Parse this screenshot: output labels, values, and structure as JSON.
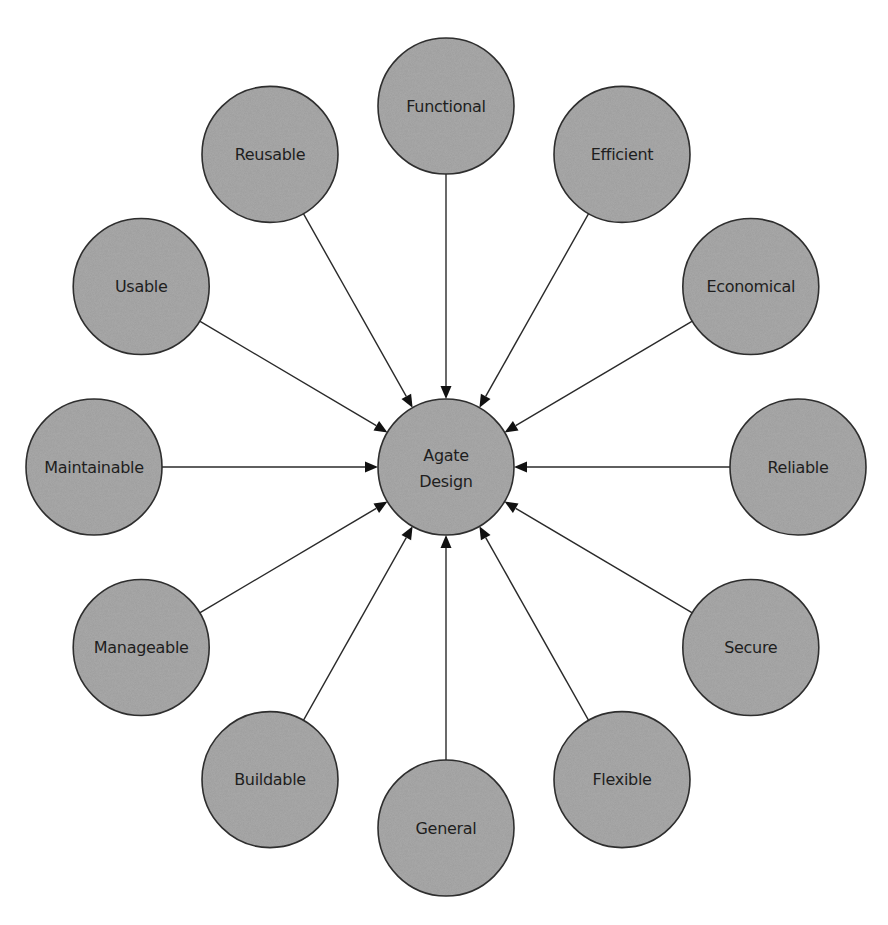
{
  "diagram": {
    "type": "hub-and-spoke",
    "direction": "inward",
    "center": {
      "id": "agate-design",
      "label_lines": [
        "Agate",
        "Design"
      ]
    },
    "nodes": [
      {
        "id": "functional",
        "label": "Functional",
        "angle_deg": 90
      },
      {
        "id": "efficient",
        "label": "Efficient",
        "angle_deg": 60
      },
      {
        "id": "economical",
        "label": "Economical",
        "angle_deg": 30
      },
      {
        "id": "reliable",
        "label": "Reliable",
        "angle_deg": 0
      },
      {
        "id": "secure",
        "label": "Secure",
        "angle_deg": -30
      },
      {
        "id": "flexible",
        "label": "Flexible",
        "angle_deg": -60
      },
      {
        "id": "general",
        "label": "General",
        "angle_deg": -90
      },
      {
        "id": "buildable",
        "label": "Buildable",
        "angle_deg": -120
      },
      {
        "id": "manageable",
        "label": "Manageable",
        "angle_deg": -150
      },
      {
        "id": "maintainable",
        "label": "Maintainable",
        "angle_deg": 180
      },
      {
        "id": "usable",
        "label": "Usable",
        "angle_deg": 150
      },
      {
        "id": "reusable",
        "label": "Reusable",
        "angle_deg": 120
      }
    ],
    "edges": [
      {
        "from": "functional",
        "to": "agate-design"
      },
      {
        "from": "efficient",
        "to": "agate-design"
      },
      {
        "from": "economical",
        "to": "agate-design"
      },
      {
        "from": "reliable",
        "to": "agate-design"
      },
      {
        "from": "secure",
        "to": "agate-design"
      },
      {
        "from": "flexible",
        "to": "agate-design"
      },
      {
        "from": "general",
        "to": "agate-design"
      },
      {
        "from": "buildable",
        "to": "agate-design"
      },
      {
        "from": "manageable",
        "to": "agate-design"
      },
      {
        "from": "maintainable",
        "to": "agate-design"
      },
      {
        "from": "usable",
        "to": "agate-design"
      },
      {
        "from": "reusable",
        "to": "agate-design"
      }
    ],
    "colors": {
      "node_fill": "#9b9b9b",
      "node_stroke": "#2e2e2e",
      "label": "#1e1e1e",
      "edge": "#2a2a2a",
      "arrowhead": "#111111",
      "background": "#ffffff"
    }
  }
}
